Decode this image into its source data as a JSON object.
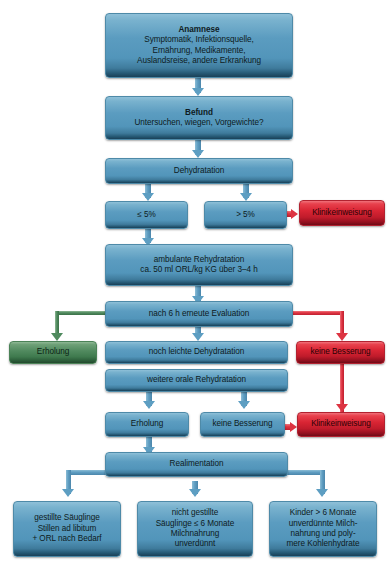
{
  "diagram": {
    "colors": {
      "blue": "#5b9cc0",
      "red": "#d92534",
      "green": "#518a5f",
      "background": "#ffffff"
    }
  },
  "nodes": {
    "anamnese": {
      "heading": "Anamnese",
      "line1": "Symptomatik, Infektionsquelle,",
      "line2": "Ernährung, Medikamente,",
      "line3": "Auslandsreise, andere Erkrankung"
    },
    "befund": {
      "heading": "Befund",
      "line1": "Untersuchen, wiegen, Vorgewichte?"
    },
    "dehydratation": {
      "label": "Dehydratation"
    },
    "lte5": {
      "label": "≤ 5%"
    },
    "gt5": {
      "label": "> 5%"
    },
    "klinik1": {
      "label": "Klinikeinweisung"
    },
    "ambulante": {
      "line1": "ambulante Rehydratation",
      "line2": "ca. 50 ml ORL/kg KG über 3–4 h"
    },
    "evaluation": {
      "label": "nach 6 h erneute Evaluation"
    },
    "erholung_left": {
      "label": "Erholung"
    },
    "leichte": {
      "label": "noch leichte Dehydratation"
    },
    "keine_besserung_right": {
      "label": "keine Besserung"
    },
    "weitere_orale": {
      "label": "weitere orale Rehydratation"
    },
    "erholung2": {
      "label": "Erholung"
    },
    "keine_besserung2": {
      "label": "keine Besserung"
    },
    "klinik2": {
      "label": "Klinikeinweisung"
    },
    "realimentation": {
      "label": "Realimentation"
    },
    "bottom_left": {
      "line1": "gestillte Säuglinge",
      "line2": "Stillen ad libitum",
      "line3": "+ ORL nach Bedarf"
    },
    "bottom_mid": {
      "line1": "nicht gestillte",
      "line2": "Säuglinge ≤ 6 Monate",
      "line3": "Milchnahrung",
      "line4": "unverdünnt"
    },
    "bottom_right": {
      "line1": "Kinder > 6 Monate",
      "line2": "unverdünnte Milch-",
      "line3": "nahrung und poly-",
      "line4": "mere Kohlenhydrate"
    }
  }
}
